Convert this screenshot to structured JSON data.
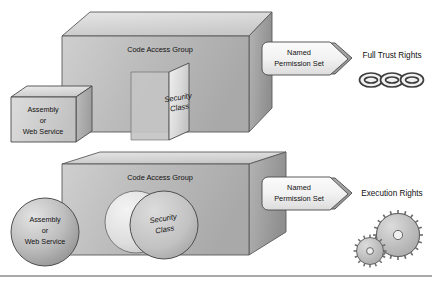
{
  "diagram": {
    "background_color": "#ffffff",
    "divider_color": "#8c8c8c",
    "rows": [
      {
        "id": "full-trust-row",
        "source": {
          "shape": "cube",
          "lines": [
            "Assembly",
            "or",
            "Web Service"
          ]
        },
        "container": {
          "shape": "cube",
          "label": "Code Access Group"
        },
        "inner": {
          "shape": "panel",
          "lines": [
            "Security",
            "Class"
          ]
        },
        "arrow": {
          "lines": [
            "Named",
            "Permission Set"
          ]
        },
        "result": {
          "label": "Full Trust Rights",
          "icon": "chain-icon",
          "icon_links": 3
        }
      },
      {
        "id": "execution-row",
        "source": {
          "shape": "sphere",
          "lines": [
            "Assembly",
            "or",
            "Web Service"
          ]
        },
        "container": {
          "shape": "cube",
          "label": "Code Access Group"
        },
        "inner": {
          "shape": "sphere-pair",
          "lines": [
            "Security",
            "Class"
          ]
        },
        "arrow": {
          "lines": [
            "Named",
            "Permission Set"
          ]
        },
        "result": {
          "label": "Execution Rights",
          "icon": "gears-icon",
          "icon_count": 2
        }
      }
    ],
    "colors": {
      "face_light": "#d8d8d8",
      "face_mid": "#bdbdbd",
      "face_dark": "#a8a8a8",
      "outline": "#4a4a4a",
      "text": "#111111"
    }
  }
}
